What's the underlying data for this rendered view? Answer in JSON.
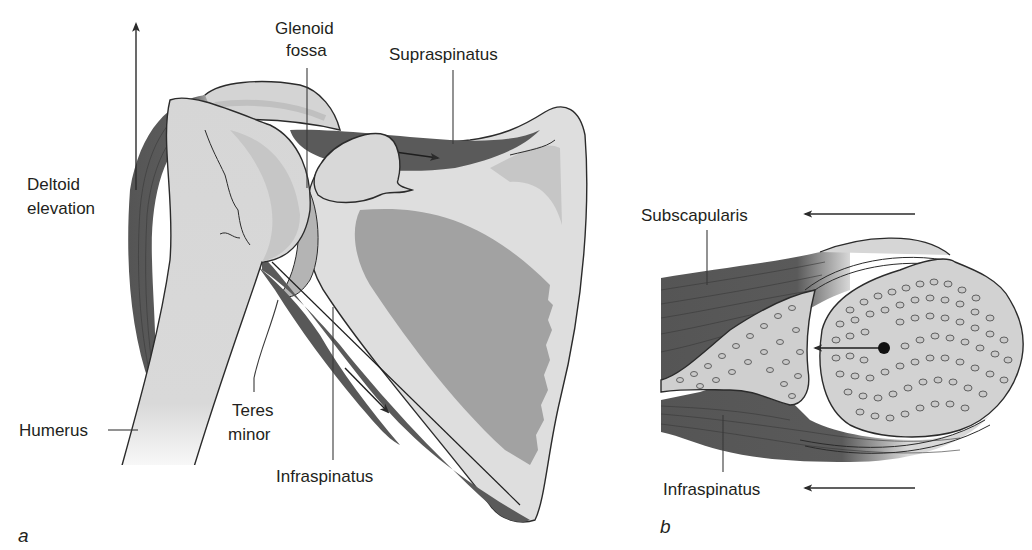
{
  "figure": {
    "panels": [
      {
        "id": "a",
        "letter": "a",
        "description": "Posterior view of shoulder: humerus, scapula and rotator cuff muscles with line-of-pull arrows",
        "labels": {
          "glenoid_fossa_line1": "Glenoid",
          "glenoid_fossa_line2": "fossa",
          "supraspinatus": "Supraspinatus",
          "deltoid_line1": "Deltoid",
          "deltoid_line2": "elevation",
          "humerus": "Humerus",
          "teres_minor_line1": "Teres",
          "teres_minor_line2": "minor",
          "infraspinatus": "Infraspinatus"
        }
      },
      {
        "id": "b",
        "letter": "b",
        "description": "Transverse section of glenohumeral joint showing subscapularis and infraspinatus force vectors compressing humeral head into glenoid",
        "labels": {
          "subscapularis": "Subscapularis",
          "infraspinatus": "Infraspinatus"
        }
      }
    ],
    "colors": {
      "background": "#ffffff",
      "bone_light": "#dcdcdc",
      "bone_mid": "#c4c4c4",
      "bone_shade": "#a9a9a9",
      "muscle_dark": "#5a5a5a",
      "muscle_fade": "#8a8a8a",
      "text": "#231f20",
      "outline": "#2b2b2b"
    }
  }
}
